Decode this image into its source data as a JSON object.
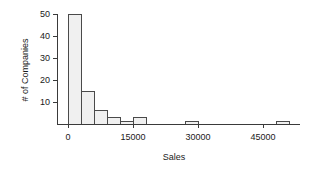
{
  "chart_data": {
    "type": "bar",
    "title": "",
    "subtitle": "",
    "xlabel": "Sales",
    "ylabel": "# of Companies",
    "grid": false,
    "legend": false,
    "legend_position": "none",
    "bin_width": 3000,
    "xlim": [
      -3000,
      54000
    ],
    "ylim": [
      0,
      51
    ],
    "xticks": [
      0,
      15000,
      30000,
      45000
    ],
    "xtick_labels": [
      "0",
      "15000",
      "30000",
      "45000"
    ],
    "yticks": [
      10,
      20,
      30,
      40,
      50
    ],
    "ytick_labels": [
      "10",
      "20",
      "30",
      "40",
      "50"
    ],
    "bin_starts": [
      0,
      3000,
      6000,
      9000,
      12000,
      15000,
      27000,
      48000
    ],
    "categories": [
      "0-3000",
      "3000-6000",
      "6000-9000",
      "9000-12000",
      "12000-15000",
      "15000-18000",
      "27000-30000",
      "48000-51000"
    ],
    "values": [
      50,
      15,
      6,
      3,
      1,
      3,
      1,
      1
    ],
    "bar_fill": "#f0f0f0",
    "bar_edge": "#4a4a4a",
    "axis_color": "#3a3a3a",
    "text_color": "#1a1a1a",
    "background": "#ffffff"
  },
  "axis": {
    "x_title": "Sales",
    "y_title": "# of Companies"
  }
}
